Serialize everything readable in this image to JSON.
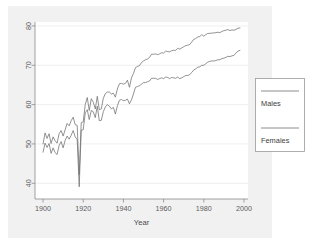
{
  "chart_data": {
    "type": "line",
    "title": "",
    "subtitle": "",
    "xlabel": "Year",
    "ylabel": "",
    "xlim": [
      1896,
      2002
    ],
    "ylim": [
      36,
      81
    ],
    "grid": true,
    "legend_position": "right",
    "x_ticks": [
      1900,
      1920,
      1940,
      1960,
      1980,
      2000
    ],
    "x_tick_labels": [
      "1900",
      "1920",
      "1940",
      "1960",
      "1980",
      "2000"
    ],
    "y_ticks": [
      40,
      50,
      60,
      70,
      80
    ],
    "y_tick_labels": [
      "40",
      "50",
      "60",
      "70",
      "80"
    ],
    "x": [
      1900,
      1901,
      1902,
      1903,
      1904,
      1905,
      1906,
      1907,
      1908,
      1909,
      1910,
      1911,
      1912,
      1913,
      1914,
      1915,
      1916,
      1917,
      1918,
      1919,
      1920,
      1921,
      1922,
      1923,
      1924,
      1925,
      1926,
      1927,
      1928,
      1929,
      1930,
      1931,
      1932,
      1933,
      1934,
      1935,
      1936,
      1937,
      1938,
      1939,
      1940,
      1941,
      1942,
      1943,
      1944,
      1945,
      1946,
      1947,
      1948,
      1949,
      1950,
      1951,
      1952,
      1953,
      1954,
      1955,
      1956,
      1957,
      1958,
      1959,
      1960,
      1961,
      1962,
      1963,
      1964,
      1965,
      1966,
      1967,
      1968,
      1969,
      1970,
      1971,
      1972,
      1973,
      1974,
      1975,
      1976,
      1977,
      1978,
      1979,
      1980,
      1981,
      1982,
      1983,
      1984,
      1985,
      1986,
      1987,
      1988,
      1989,
      1990,
      1991,
      1992,
      1993,
      1994,
      1995,
      1996,
      1997,
      1998
    ],
    "series": [
      {
        "name": "Females",
        "color": "#6e6e6e",
        "values": [
          50.0,
          52.8,
          51.4,
          52.6,
          50.1,
          51.8,
          50.8,
          50.2,
          52.6,
          53.4,
          52.0,
          53.6,
          55.2,
          54.6,
          55.9,
          56.8,
          54.9,
          54.7,
          42.2,
          55.4,
          55.6,
          60.0,
          61.8,
          58.5,
          61.5,
          60.6,
          58.9,
          62.1,
          58.7,
          58.9,
          61.6,
          62.8,
          63.2,
          63.2,
          62.7,
          62.9,
          61.9,
          64.0,
          65.3,
          65.4,
          65.2,
          65.4,
          66.2,
          64.4,
          66.8,
          67.9,
          69.4,
          69.7,
          69.9,
          70.7,
          71.1,
          71.4,
          71.6,
          72.0,
          72.8,
          72.8,
          72.9,
          72.7,
          72.9,
          73.2,
          73.1,
          73.6,
          73.5,
          73.4,
          73.7,
          73.8,
          73.8,
          74.3,
          74.1,
          74.4,
          74.7,
          75.0,
          75.1,
          75.3,
          75.9,
          76.6,
          76.8,
          77.2,
          77.3,
          77.8,
          77.4,
          77.8,
          78.1,
          78.1,
          78.2,
          78.2,
          78.3,
          78.4,
          78.3,
          78.6,
          78.8,
          78.9,
          79.1,
          78.8,
          79.0,
          78.9,
          79.1,
          79.4,
          79.5
        ]
      },
      {
        "name": "Males",
        "color": "#6e6e6e",
        "values": [
          47.9,
          50.2,
          49.1,
          50.1,
          47.6,
          49.0,
          47.8,
          47.3,
          49.6,
          50.6,
          49.0,
          50.9,
          52.0,
          51.2,
          52.2,
          53.4,
          51.8,
          51.1,
          39.1,
          53.5,
          53.6,
          57.9,
          58.7,
          56.2,
          58.5,
          58.2,
          56.7,
          59.6,
          55.9,
          56.0,
          58.2,
          59.4,
          60.0,
          59.6,
          58.9,
          59.3,
          57.6,
          59.7,
          61.1,
          61.3,
          61.0,
          61.1,
          61.4,
          60.2,
          61.2,
          62.7,
          64.4,
          64.6,
          64.8,
          65.2,
          65.6,
          65.6,
          65.8,
          66.0,
          66.7,
          66.7,
          66.7,
          66.4,
          66.6,
          66.8,
          66.6,
          67.0,
          66.9,
          66.6,
          66.9,
          66.8,
          66.7,
          67.0,
          66.6,
          66.8,
          67.1,
          67.4,
          67.4,
          67.6,
          68.2,
          68.8,
          69.1,
          69.5,
          69.6,
          70.0,
          70.0,
          70.4,
          70.8,
          71.0,
          71.1,
          71.1,
          71.2,
          71.4,
          71.4,
          71.7,
          71.8,
          72.0,
          72.3,
          72.2,
          72.4,
          72.5,
          73.1,
          73.6,
          73.8
        ]
      }
    ],
    "annotations": []
  },
  "legend": {
    "entries": [
      {
        "label": "Males"
      },
      {
        "label": "Females"
      }
    ]
  },
  "axis": {
    "x_title": "Year"
  },
  "colors": {
    "page_background": "#ffffff",
    "figure_background": "#f1f1f1",
    "panel_background": "#ffffff",
    "axis": "#8a8a8a",
    "grid": "#e2e2e2",
    "text": "#4a4a4a",
    "series_line": "#6e6e6e",
    "legend_border": "#9a9a9a"
  }
}
